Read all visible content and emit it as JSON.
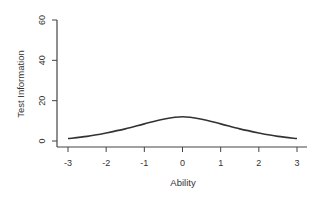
{
  "chart_data": {
    "type": "line",
    "title": "",
    "xlabel": "Ability",
    "ylabel": "Test Information",
    "xlim": [
      -3.2,
      3.2
    ],
    "ylim": [
      0,
      60
    ],
    "x_ticks": [
      -3,
      -2,
      -1,
      0,
      1,
      2,
      3
    ],
    "x_tick_labels": [
      "-3",
      "-2",
      "-1",
      "0",
      "1",
      "2",
      "3"
    ],
    "y_ticks": [
      0,
      20,
      40,
      60
    ],
    "y_tick_labels": [
      "0",
      "20",
      "40",
      "60"
    ],
    "grid": false,
    "legend": null,
    "series": [
      {
        "name": "Test Information",
        "x": [
          -3,
          -2.5,
          -2,
          -1.5,
          -1,
          -0.5,
          0,
          0.5,
          1,
          1.5,
          2,
          2.5,
          3
        ],
        "y": [
          1.2,
          2.3,
          4.0,
          6.0,
          8.5,
          10.8,
          12.0,
          10.8,
          8.5,
          6.0,
          4.0,
          2.3,
          1.2
        ]
      }
    ],
    "colors": {
      "line": "#333333",
      "axis": "#444444"
    }
  }
}
